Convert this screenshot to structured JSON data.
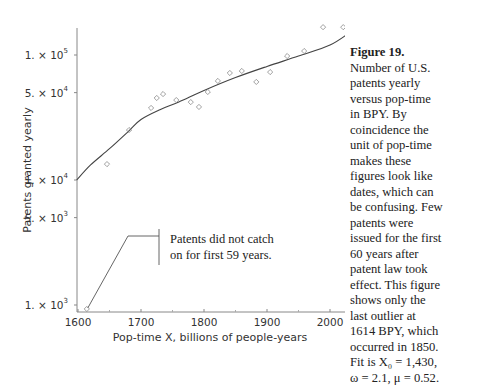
{
  "chart_data": {
    "type": "scatter",
    "title": "",
    "xlabel": "Pop-time X, billions of people-years",
    "ylabel": "Patents granted yearly",
    "xlim": [
      1600,
      2050
    ],
    "ylim": [
      900,
      200000
    ],
    "yscale": "log",
    "grid": false,
    "xticks": [
      {
        "value": 1600,
        "label": "1600"
      },
      {
        "value": 1700,
        "label": "1700"
      },
      {
        "value": 1800,
        "label": "1800"
      },
      {
        "value": 1900,
        "label": "1900"
      },
      {
        "value": 2000,
        "label": "2000"
      }
    ],
    "xminor": [
      1650,
      1750,
      1850,
      1950
    ],
    "yticks": [
      {
        "value": 100000,
        "mant": "1. × 10",
        "exp": "5"
      },
      {
        "value": 50000,
        "mant": "5. × 10",
        "exp": "4"
      },
      {
        "value": 10000,
        "mant": "1. × 10",
        "exp": "4"
      },
      {
        "value": 5000,
        "mant": "5. × 10",
        "exp": "3"
      },
      {
        "value": 1000,
        "mant": "1. × 10",
        "exp": "3"
      }
    ],
    "series": [
      {
        "name": "observed",
        "marker": "diamond-open",
        "x": [
          1614,
          1646,
          1681,
          1716,
          1725,
          1735,
          1756,
          1779,
          1792,
          1806,
          1822,
          1841,
          1860,
          1883,
          1905,
          1932,
          1959,
          1989,
          2021
        ],
        "y": [
          930,
          13400,
          25100,
          37700,
          45300,
          48700,
          43600,
          42000,
          38400,
          50600,
          62000,
          71800,
          74500,
          60900,
          73000,
          98100,
          107600,
          167000,
          167000
        ]
      },
      {
        "name": "fit",
        "marker": "line",
        "x": [
          1598,
          1620,
          1650,
          1680,
          1700,
          1730,
          1760,
          1800,
          1850,
          1900,
          1950,
          2000,
          2032
        ],
        "y": [
          10000,
          13200,
          17800,
          24500,
          30500,
          36500,
          42000,
          52000,
          66000,
          81000,
          98000,
          120000,
          152000
        ]
      }
    ],
    "annotation": {
      "text_lines": [
        "Patents did not catch",
        "on for first 59 years."
      ],
      "points_to": {
        "x": 1614,
        "y": 930
      }
    }
  },
  "caption": {
    "title": "Figure 19.",
    "lines": [
      "Number of U.S.",
      "patents yearly",
      "versus pop-time",
      "in BPY. By",
      "coincidence the",
      "unit of pop-time",
      "makes these",
      "figures look like",
      "dates, which can",
      "be confusing. Few",
      "patents were",
      "issued for the first",
      "60 years after",
      "patent law took",
      "effect. This figure",
      "shows only the",
      "last outlier at",
      "1614 BPY, which",
      "occurred in 1850.",
      "Fit is X₀ = 1,430,",
      "ω = 2.1, μ = 0.52."
    ]
  }
}
